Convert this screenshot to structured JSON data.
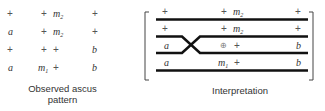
{
  "observed": {
    "caption_line1": "Observed ascus",
    "caption_line2": "pattern",
    "rows": [
      {
        "col1": "+",
        "col2a": "+",
        "col2b": "m",
        "col2b_sub": "2",
        "col3": "+"
      },
      {
        "col1": "a",
        "col2a": "+",
        "col2b": "m",
        "col2b_sub": "2",
        "col3": "+"
      },
      {
        "col1": "+",
        "col2a": "+",
        "col2b": "+",
        "col2b_sub": "",
        "col3": "b"
      },
      {
        "col1": "a",
        "col2a": "m",
        "col2a_sub": "1",
        "col2b": "+",
        "col2b_sub": "",
        "col3": "b"
      }
    ]
  },
  "interpretation": {
    "caption": "Interpretation",
    "rows": [
      {
        "left": "+",
        "mid_a": "+",
        "mid_b": "m",
        "mid_b_sub": "2",
        "right": "+"
      },
      {
        "left": "+",
        "mid_a": "+",
        "mid_b": "m",
        "mid_b_sub": "2",
        "right": "+"
      },
      {
        "left": "a",
        "mid_a": "⊕",
        "mid_b": "+",
        "mid_b_sub": "",
        "right": "b"
      },
      {
        "left": "a",
        "mid_a": "m",
        "mid_a_sub": "1",
        "mid_b": "+",
        "mid_b_sub": "",
        "right": "b"
      }
    ],
    "crossover": "chromatids 2 and 3",
    "colors": {
      "line": "#111111",
      "bracket": "#444444"
    }
  }
}
